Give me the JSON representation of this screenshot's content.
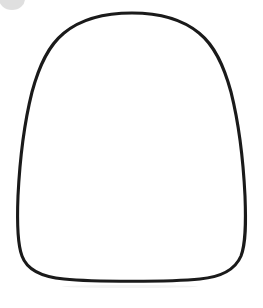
{
  "canvas": {
    "width": 263,
    "height": 308,
    "background_color": "#ffffff",
    "alt_text": "Hand-drawn rounded bell shape outline"
  },
  "artwork": {
    "title": "Bell shape outline",
    "shape_name": "rounded-bell-outline",
    "description": "A closed freehand-style outline: narrow rounded dome at the top widening toward a broad, nearly flat base with rounded bottom corners.",
    "stroke_color": "#1a1a1a",
    "fill_color": "#ffffff",
    "stroke_width": 3.1,
    "bounding_box": {
      "left": 18,
      "top": 12,
      "right": 246,
      "bottom": 280
    },
    "path": "M 132 13 C 158 13 182 19 199 33 C 215 46 224 66 231 92 C 238 120 243 155 245 196 C 246 222 246 243 241 256 C 235 270 221 277 200 279 C 172 282 92 282 64 279 C 42 277 27 270 22 256 C 17 243 17 221 18 196 C 20 155 25 120 32 92 C 39 66 48 46 64 33 C 81 19 106 13 132 13 Z"
  },
  "decorations": {
    "corner_disc": {
      "name": "grey-partial-circle",
      "color": "#d9d9d9",
      "position": "top-left",
      "clipped": true
    },
    "bottom_smudge": {
      "name": "faint-grey-smudge",
      "color": "#f2f2f2",
      "position": "below-shape"
    }
  }
}
